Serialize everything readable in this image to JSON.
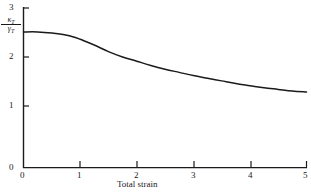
{
  "chart_data": {
    "type": "line",
    "title": "",
    "xlabel": "Total strain",
    "ylabel_numerator": "κ",
    "ylabel_numerator_sub": "T",
    "ylabel_denominator": "γ",
    "ylabel_denominator_sub": "T",
    "xlim": [
      0,
      5
    ],
    "ylim": [
      0,
      3
    ],
    "xticks": [
      0,
      1,
      2,
      3,
      4,
      5
    ],
    "yticks": [
      0,
      1,
      2,
      3
    ],
    "xtick_labels": [
      "0",
      "1",
      "2",
      "3",
      "4",
      "5"
    ],
    "ytick_labels": [
      "0",
      "1",
      "2",
      "3"
    ],
    "grid": false,
    "legend": false,
    "line_color": "#1a1a1a",
    "axis_color": "#1a1a1a",
    "background": "#ffffff",
    "x": [
      0.0,
      0.25,
      0.5,
      0.7,
      0.9,
      1.1,
      1.3,
      1.5,
      1.75,
      2.0,
      2.25,
      2.5,
      2.75,
      3.0,
      3.25,
      3.5,
      3.75,
      4.0,
      4.25,
      4.5,
      4.75,
      5.0
    ],
    "values": [
      2.55,
      2.55,
      2.53,
      2.5,
      2.45,
      2.37,
      2.28,
      2.18,
      2.08,
      2.0,
      1.92,
      1.85,
      1.79,
      1.73,
      1.68,
      1.63,
      1.58,
      1.54,
      1.5,
      1.47,
      1.44,
      1.42
    ]
  },
  "ticks": {
    "x": [
      {
        "label": "0",
        "left": 20,
        "top": 171
      },
      {
        "label": "1",
        "left": 77,
        "top": 171
      },
      {
        "label": "2",
        "left": 134,
        "top": 171
      },
      {
        "label": "3",
        "left": 191,
        "top": 171
      },
      {
        "label": "4",
        "left": 248,
        "top": 171
      },
      {
        "label": "5",
        "left": 303,
        "top": 171
      }
    ],
    "y": [
      {
        "label": "0",
        "left": 9,
        "top": 163
      },
      {
        "label": "1",
        "left": 9,
        "top": 101
      },
      {
        "label": "2",
        "left": 9,
        "top": 52
      },
      {
        "label": "3",
        "left": 9,
        "top": 3
      }
    ]
  },
  "axis_title": {
    "x_label": "Total strain",
    "x_left": 117,
    "x_top": 180
  }
}
